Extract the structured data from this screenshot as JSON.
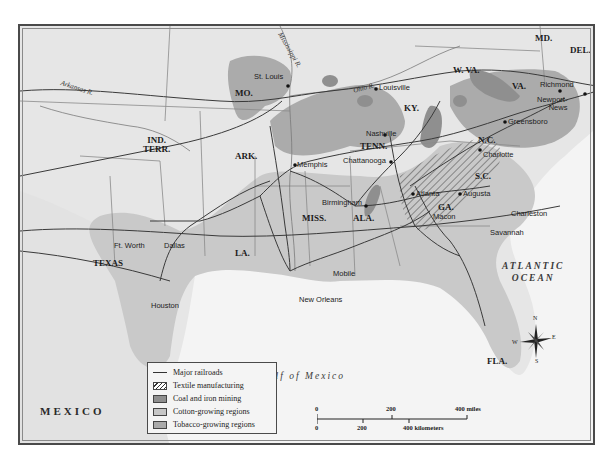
{
  "map": {
    "title": "Industry and Agriculture in the South",
    "colors": {
      "land": "#e6e6e6",
      "water": "#f4f4f4",
      "cotton": "#c6c6c6",
      "tobacco": "#a9a9a9",
      "coal_iron": "#8f8f8f",
      "railroad": "#3a3a3a",
      "border": "#8a8a8a"
    },
    "states": [
      {
        "id": "mo",
        "label": "MO."
      },
      {
        "id": "ky",
        "label": "KY."
      },
      {
        "id": "wva",
        "label": "W. VA."
      },
      {
        "id": "va",
        "label": "VA."
      },
      {
        "id": "md",
        "label": "MD."
      },
      {
        "id": "del",
        "label": "DEL."
      },
      {
        "id": "ind-terr",
        "label": "IND.\nTERR."
      },
      {
        "id": "ark",
        "label": "ARK."
      },
      {
        "id": "tenn",
        "label": "TENN."
      },
      {
        "id": "nc",
        "label": "N.C."
      },
      {
        "id": "sc",
        "label": "S.C."
      },
      {
        "id": "miss",
        "label": "MISS."
      },
      {
        "id": "ala",
        "label": "ALA."
      },
      {
        "id": "ga",
        "label": "GA."
      },
      {
        "id": "la",
        "label": "LA."
      },
      {
        "id": "texas",
        "label": "TEXAS"
      },
      {
        "id": "fla",
        "label": "FLA."
      }
    ],
    "cities": [
      {
        "id": "st-louis",
        "label": "St. Louis"
      },
      {
        "id": "louisville",
        "label": "Louisville"
      },
      {
        "id": "richmond",
        "label": "Richmond"
      },
      {
        "id": "newport-news",
        "label": "Newport-\nNews"
      },
      {
        "id": "greensboro",
        "label": "Greensboro"
      },
      {
        "id": "nashville",
        "label": "Nashville"
      },
      {
        "id": "chattanooga",
        "label": "Chattanooga"
      },
      {
        "id": "charlotte",
        "label": "Charlotte"
      },
      {
        "id": "memphis",
        "label": "Memphis"
      },
      {
        "id": "atlanta",
        "label": "Atlanta"
      },
      {
        "id": "augusta",
        "label": "Augusta"
      },
      {
        "id": "birmingham",
        "label": "Birmingham"
      },
      {
        "id": "macon",
        "label": "Macon"
      },
      {
        "id": "charleston",
        "label": "Charleston"
      },
      {
        "id": "savannah",
        "label": "Savannah"
      },
      {
        "id": "ft-worth",
        "label": "Ft. Worth"
      },
      {
        "id": "dallas",
        "label": "Dallas"
      },
      {
        "id": "mobile",
        "label": "Mobile"
      },
      {
        "id": "houston",
        "label": "Houston"
      },
      {
        "id": "new-orleans",
        "label": "New Orleans"
      }
    ],
    "rivers": [
      {
        "id": "arkansas",
        "label": "Arkansas R."
      },
      {
        "id": "mississippi",
        "label": "Mississippi R."
      },
      {
        "id": "ohio",
        "label": "Ohio R."
      }
    ],
    "water_bodies": [
      {
        "id": "atlantic",
        "label": "ATLANTIC\nOCEAN"
      },
      {
        "id": "gulf",
        "label": "Gulf of Mexico"
      }
    ],
    "countries": [
      {
        "id": "mexico",
        "label": "MEXICO"
      }
    ]
  },
  "legend": {
    "items": [
      {
        "type": "line",
        "label": "Major railroads"
      },
      {
        "type": "hatch",
        "label": "Textile manufacturing",
        "color": "#ffffff"
      },
      {
        "type": "fill",
        "label": "Coal and iron mining",
        "color": "#8f8f8f"
      },
      {
        "type": "fill",
        "label": "Cotton-growing regions",
        "color": "#c6c6c6"
      },
      {
        "type": "fill",
        "label": "Tobacco-growing regions",
        "color": "#a9a9a9"
      }
    ]
  },
  "scale": {
    "miles": {
      "ticks": [
        "0",
        "200",
        "400 miles"
      ]
    },
    "kilometers": {
      "ticks": [
        "0",
        "200",
        "400 kilometers"
      ]
    }
  },
  "compass": {
    "n": "N",
    "s": "S",
    "e": "E",
    "w": "W"
  }
}
